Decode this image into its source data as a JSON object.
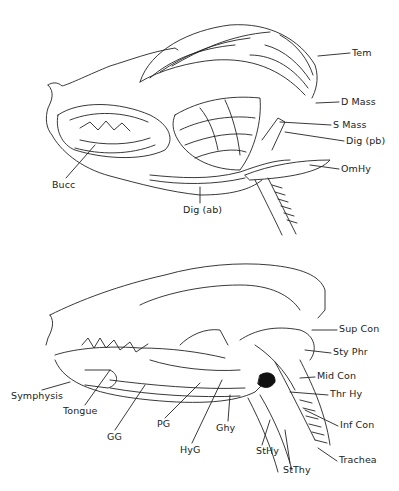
{
  "figure": {
    "top_panel": {
      "description": "Lateral view of canine head — superficial jaw muscles",
      "labels": [
        {
          "id": "tem",
          "text": "Tem",
          "x": 352,
          "y": 50
        },
        {
          "id": "d_mass",
          "text": "D Mass",
          "x": 341,
          "y": 99
        },
        {
          "id": "s_mass",
          "text": "S Mass",
          "x": 333,
          "y": 122
        },
        {
          "id": "dig_pb",
          "text": "Dig (pb)",
          "x": 346,
          "y": 138
        },
        {
          "id": "omhy",
          "text": "OmHy",
          "x": 341,
          "y": 166
        },
        {
          "id": "bucc",
          "text": "Bucc",
          "x": 52,
          "y": 182
        },
        {
          "id": "dig_ab",
          "text": "Dig (ab)",
          "x": 183,
          "y": 207
        }
      ]
    },
    "bottom_panel": {
      "description": "Lateral view of canine head — deep tongue, hyoid and pharyngeal muscles",
      "labels": [
        {
          "id": "sup_con",
          "text": "Sup Con",
          "x": 339,
          "y": 326
        },
        {
          "id": "sty_phr",
          "text": "Sty Phr",
          "x": 333,
          "y": 349
        },
        {
          "id": "mid_con",
          "text": "Mid Con",
          "x": 317,
          "y": 373
        },
        {
          "id": "thr_hy",
          "text": "Thr Hy",
          "x": 330,
          "y": 391
        },
        {
          "id": "inf_con",
          "text": "Inf Con",
          "x": 340,
          "y": 422
        },
        {
          "id": "trachea",
          "text": "Trachea",
          "x": 339,
          "y": 457
        },
        {
          "id": "symphysis",
          "text": "Symphysis",
          "x": 11,
          "y": 393
        },
        {
          "id": "tongue",
          "text": "Tongue",
          "x": 63,
          "y": 408
        },
        {
          "id": "gg",
          "text": "GG",
          "x": 107,
          "y": 434
        },
        {
          "id": "pg",
          "text": "PG",
          "x": 157,
          "y": 421
        },
        {
          "id": "ghy",
          "text": "Ghy",
          "x": 216,
          "y": 425
        },
        {
          "id": "hyg",
          "text": "HyG",
          "x": 180,
          "y": 447
        },
        {
          "id": "sthy",
          "text": "StHy",
          "x": 256,
          "y": 448
        },
        {
          "id": "stthy",
          "text": "StThy",
          "x": 283,
          "y": 467
        }
      ]
    },
    "colors": {
      "ink": "#1a1a1a",
      "background": "#ffffff"
    }
  }
}
